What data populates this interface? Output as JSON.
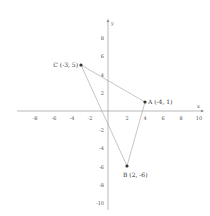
{
  "diagram": {
    "type": "coordinate-plane-triangle",
    "axes": {
      "x_label": "x",
      "y_label": "y",
      "x_ticks": [
        "-8",
        "-6",
        "-4",
        "-2",
        "2",
        "4",
        "6",
        "8",
        "10"
      ],
      "y_ticks": [
        "8",
        "6",
        "4",
        "2",
        "-2",
        "-4",
        "-6",
        "-8",
        "-10"
      ]
    },
    "points": [
      {
        "name": "C",
        "label": "C (-3, 5)",
        "x": -3,
        "y": 5
      },
      {
        "name": "A",
        "label": "A (-4, 1)",
        "x": 4,
        "y": 1
      },
      {
        "name": "B",
        "label": "B (2, -6)",
        "x": 2,
        "y": -6
      }
    ],
    "colors": {
      "axis": "#888888",
      "edge": "#999999",
      "point": "#333333",
      "text": "#444444"
    }
  }
}
